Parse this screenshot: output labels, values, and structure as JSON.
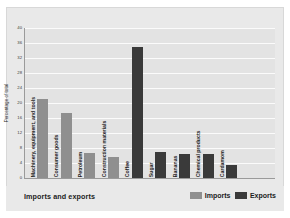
{
  "chart_data": {
    "type": "bar",
    "title": "Imports and exports",
    "xlabel": "",
    "ylabel": "Percentage of total",
    "ylim": [
      0,
      40
    ],
    "yticks": [
      0,
      4,
      8,
      12,
      16,
      20,
      24,
      28,
      32,
      36,
      40
    ],
    "grid": true,
    "legend_position": "bottom-right",
    "categories": [
      "Machinery, equipment, and tools",
      "Consumer goods",
      "Petroleum",
      "Construction materials",
      "Coffee",
      "Sugar",
      "Bananas",
      "Chemical products",
      "Cardamom"
    ],
    "series": [
      {
        "name": "Imports",
        "color": "#8f8f8f",
        "values": [
          21,
          17.3,
          6.7,
          5.6,
          null,
          null,
          null,
          null,
          null
        ]
      },
      {
        "name": "Exports",
        "color": "#3a3a3a",
        "values": [
          null,
          null,
          null,
          null,
          35,
          7,
          6.4,
          6.4,
          3.5
        ]
      }
    ],
    "bars": [
      {
        "category": "Machinery, equipment, and tools",
        "series": "Imports",
        "value": 21
      },
      {
        "category": "Consumer goods",
        "series": "Imports",
        "value": 17.3
      },
      {
        "category": "Petroleum",
        "series": "Imports",
        "value": 6.7
      },
      {
        "category": "Construction materials",
        "series": "Imports",
        "value": 5.6
      },
      {
        "category": "Coffee",
        "series": "Exports",
        "value": 35
      },
      {
        "category": "Sugar",
        "series": "Exports",
        "value": 7
      },
      {
        "category": "Bananas",
        "series": "Exports",
        "value": 6.4
      },
      {
        "category": "Chemical products",
        "series": "Exports",
        "value": 6.4
      },
      {
        "category": "Cardamom",
        "series": "Exports",
        "value": 3.5
      }
    ]
  },
  "legend": {
    "items": [
      {
        "label": "Imports",
        "color": "#8f8f8f"
      },
      {
        "label": "Exports",
        "color": "#3a3a3a"
      }
    ]
  },
  "colors": {
    "imports": "#8f8f8f",
    "exports": "#3a3a3a",
    "panel": "#e9e9e9",
    "plot": "#e3e3e3",
    "gridline": "#fbfbfb"
  }
}
